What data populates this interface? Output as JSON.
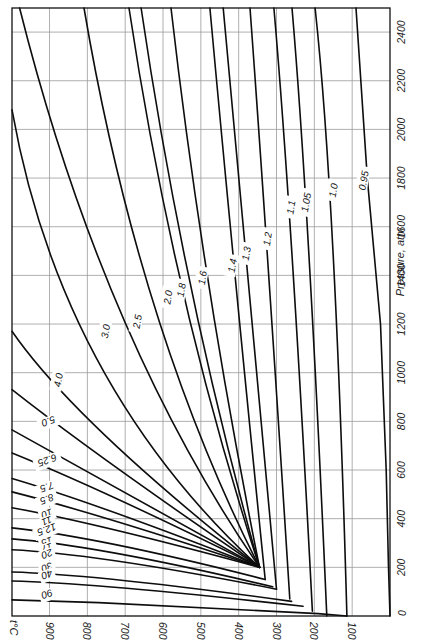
{
  "chart_data": {
    "type": "line",
    "title": "",
    "orientation": "rotated 90° (printed sideways)",
    "xlabel": "t°C",
    "ylabel": "Pressure, atm",
    "x_axis": {
      "label": "t°C",
      "ticks": [
        900,
        800,
        700,
        600,
        500,
        400,
        300,
        200,
        100
      ],
      "range": [
        0,
        1000
      ],
      "reversed": true
    },
    "y_axis": {
      "label": "Pressure, atm",
      "ticks": [
        0,
        200,
        400,
        600,
        800,
        1000,
        1200,
        1400,
        1600,
        1800,
        2000,
        2200,
        2400
      ],
      "range": [
        0,
        2500
      ]
    },
    "grid": true,
    "legend": "inline curve labels",
    "series": [
      {
        "name": "0.95",
        "points": [
          [
            90,
            2500
          ],
          [
            60,
            1800
          ],
          [
            25,
            1200
          ],
          [
            10,
            600
          ],
          [
            4,
            200
          ],
          [
            0,
            0
          ]
        ]
      },
      {
        "name": "1.0",
        "points": [
          [
            198,
            2500
          ],
          [
            145,
            1740
          ],
          [
            114,
            0
          ]
        ]
      },
      {
        "name": "1.05",
        "points": [
          [
            259,
            2500
          ],
          [
            215,
            1700
          ],
          [
            167,
            0
          ]
        ]
      },
      {
        "name": "1.1",
        "points": [
          [
            307,
            2500
          ],
          [
            260,
            1660
          ],
          [
            205,
            20
          ]
        ]
      },
      {
        "name": "1.2",
        "points": [
          [
            370,
            2500
          ],
          [
            325,
            1540
          ],
          [
            265,
            70
          ]
        ]
      },
      {
        "name": "1.3",
        "points": [
          [
            441,
            2500
          ],
          [
            378,
            1470
          ],
          [
            300,
            110
          ]
        ]
      },
      {
        "name": "1.4",
        "points": [
          [
            476,
            2500
          ],
          [
            413,
            1420
          ],
          [
            330,
            150
          ]
        ]
      },
      {
        "name": "1.6",
        "points": [
          [
            579,
            2500
          ],
          [
            495,
            1360
          ],
          [
            345,
            200
          ]
        ]
      },
      {
        "name": "1.8",
        "points": [
          [
            658,
            2500
          ],
          [
            545,
            1310
          ],
          [
            345,
            200
          ]
        ]
      },
      {
        "name": "2.0",
        "points": [
          [
            690,
            2500
          ],
          [
            573,
            1290
          ],
          [
            345,
            200
          ]
        ]
      },
      {
        "name": "2.5",
        "points": [
          [
            809,
            2500
          ],
          [
            665,
            1180
          ],
          [
            345,
            200
          ]
        ]
      },
      {
        "name": "3.0",
        "points": [
          [
            979,
            2500
          ],
          [
            760,
            1140
          ],
          [
            345,
            200
          ]
        ]
      },
      {
        "name": "4.0",
        "points": [
          [
            1000,
            2080
          ],
          [
            870,
            950
          ],
          [
            345,
            200
          ]
        ]
      },
      {
        "name": "5.0",
        "points": [
          [
            1000,
            1170
          ],
          [
            835,
            800
          ],
          [
            345,
            200
          ]
        ]
      },
      {
        "name": "6.25",
        "points": [
          [
            1000,
            930
          ],
          [
            770,
            650
          ],
          [
            345,
            200
          ]
        ]
      },
      {
        "name": "7.5",
        "points": [
          [
            1000,
            765
          ],
          [
            760,
            560
          ],
          [
            345,
            200
          ]
        ]
      },
      {
        "name": "8.5",
        "points": [
          [
            1000,
            670
          ],
          [
            760,
            520
          ],
          [
            345,
            200
          ]
        ]
      },
      {
        "name": "10",
        "points": [
          [
            1000,
            565
          ],
          [
            770,
            460
          ],
          [
            345,
            200
          ]
        ]
      },
      {
        "name": "11",
        "points": [
          [
            1000,
            510
          ],
          [
            770,
            420
          ],
          [
            345,
            200
          ]
        ]
      },
      {
        "name": "12.5",
        "points": [
          [
            1000,
            445
          ],
          [
            770,
            380
          ],
          [
            345,
            200
          ]
        ]
      },
      {
        "name": "15",
        "points": [
          [
            1000,
            362
          ],
          [
            770,
            325
          ],
          [
            330,
            150
          ]
        ]
      },
      {
        "name": "17",
        "points": [
          [
            1000,
            317
          ],
          [
            770,
            290
          ],
          [
            310,
            120
          ]
        ]
      },
      {
        "name": "20",
        "points": [
          [
            1000,
            272
          ],
          [
            770,
            255
          ],
          [
            300,
            110
          ]
        ]
      },
      {
        "name": "30",
        "points": [
          [
            1000,
            181
          ],
          [
            770,
            170
          ],
          [
            260,
            60
          ]
        ]
      },
      {
        "name": "40",
        "points": [
          [
            1000,
            144
          ],
          [
            770,
            135
          ],
          [
            230,
            40
          ]
        ]
      },
      {
        "name": "90",
        "points": [
          [
            1000,
            66
          ],
          [
            770,
            55
          ],
          [
            190,
            10
          ],
          [
            114,
            0
          ]
        ]
      }
    ],
    "label_positions": {
      "0.95": [
        70,
        1790
      ],
      "1.0": [
        150,
        1750
      ],
      "1.05": [
        222,
        1700
      ],
      "1.1": [
        262,
        1680
      ],
      "1.2": [
        324,
        1550
      ],
      "1.3": [
        380,
        1490
      ],
      "1.4": [
        417,
        1440
      ],
      "1.6": [
        496,
        1390
      ],
      "1.8": [
        552,
        1340
      ],
      "2.0": [
        587,
        1310
      ],
      "2.5": [
        668,
        1210
      ],
      "3.0": [
        752,
        1170
      ],
      "4.0": [
        877,
        970
      ],
      "5.0": [
        903,
        800
      ],
      "6.25": [
        906,
        640
      ],
      "7.5": [
        907,
        530
      ],
      "8.5": [
        907,
        480
      ],
      "10": [
        907,
        420
      ],
      "11": [
        907,
        390
      ],
      "12.5": [
        907,
        355
      ],
      "15": [
        907,
        305
      ],
      "17": [
        907,
        280
      ],
      "20": [
        907,
        255
      ],
      "30": [
        907,
        200
      ],
      "40": [
        907,
        170
      ],
      "90": [
        907,
        90
      ]
    }
  },
  "axes_text": {
    "pressure_title": "Pressure, atm",
    "temp_title": "t°C",
    "temp_ticks": [
      "900",
      "800",
      "700",
      "600",
      "500",
      "400",
      "300",
      "200",
      "100"
    ],
    "pressure_ticks": [
      "0",
      "200",
      "400",
      "600",
      "800",
      "1000",
      "1200",
      "1400",
      "1600",
      "1800",
      "2000",
      "2200",
      "2400"
    ]
  }
}
